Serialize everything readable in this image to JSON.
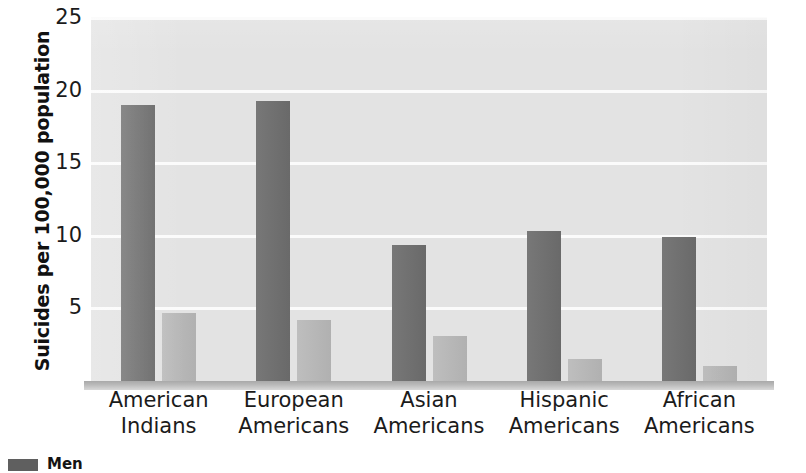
{
  "chart_data": {
    "type": "bar",
    "title": "",
    "xlabel": "",
    "ylabel": "Suicides per 100,000 population",
    "ylim": [
      0,
      25
    ],
    "yticks": [
      5,
      10,
      15,
      20,
      25
    ],
    "grid": true,
    "legend_position": "bottom-left",
    "categories": [
      "American Indians",
      "European Americans",
      "Asian Americans",
      "Hispanic Americans",
      "African Americans"
    ],
    "category_lines": [
      [
        "American",
        "Indians"
      ],
      [
        "European",
        "Americans"
      ],
      [
        "Asian",
        "Americans"
      ],
      [
        "Hispanic",
        "Americans"
      ],
      [
        "African",
        "Americans"
      ]
    ],
    "series": [
      {
        "name": "Men",
        "color": "#6f6f6f",
        "values": [
          19.0,
          19.3,
          9.4,
          10.3,
          9.9
        ]
      },
      {
        "name": "Women",
        "color": "#bababa",
        "values": [
          4.7,
          4.2,
          3.1,
          1.5,
          1.0
        ]
      }
    ]
  },
  "colors": {
    "plot_background": "#e3e3e3",
    "gridline": "#fbfbfb",
    "bar_dark": "#6f6f6f",
    "bar_light": "#bababa",
    "text": "#1b1b1b"
  },
  "legend": {
    "items": [
      {
        "label": "Men",
        "color": "#5f5f5f"
      }
    ]
  }
}
